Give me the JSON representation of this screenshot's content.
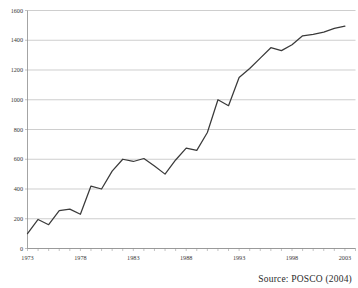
{
  "source_note": "Source: POSCO (2004)",
  "chart_data": {
    "type": "line",
    "title": "",
    "subtitle": "",
    "xlabel": "",
    "ylabel": "",
    "xlim": [
      1973,
      2004
    ],
    "ylim": [
      0,
      1600
    ],
    "ytick_values": [
      0,
      200,
      400,
      600,
      800,
      1000,
      1200,
      1400,
      1600
    ],
    "ytick_labels": [
      "0",
      "200",
      "400",
      "600",
      "800",
      "1000",
      "1200",
      "1400",
      "1600"
    ],
    "xtick_labels": [
      "1973",
      "1978",
      "1983",
      "1988",
      "1993",
      "1998",
      "2003"
    ],
    "xtick_values": [
      1973,
      1978,
      1983,
      1988,
      1993,
      1998,
      2003
    ],
    "minor_xticks_every": 1,
    "grid": "horizontal",
    "legend": "none",
    "line_color": "#3a3a3a",
    "grid_color": "#b9b9b9",
    "series": [
      {
        "name": "value",
        "x": [
          1973,
          1974,
          1975,
          1976,
          1977,
          1978,
          1979,
          1980,
          1981,
          1982,
          1983,
          1984,
          1985,
          1986,
          1987,
          1988,
          1989,
          1990,
          1991,
          1992,
          1993,
          1994,
          1995,
          1996,
          1997,
          1998,
          1999,
          2000,
          2001,
          2002,
          2003
        ],
        "values": [
          100,
          195,
          160,
          255,
          265,
          230,
          420,
          400,
          520,
          600,
          585,
          605,
          555,
          500,
          595,
          675,
          660,
          780,
          1000,
          960,
          1150,
          1210,
          1280,
          1350,
          1330,
          1370,
          1430,
          1440,
          1455,
          1480,
          1495
        ]
      }
    ]
  }
}
